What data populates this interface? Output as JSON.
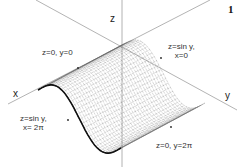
{
  "figure": {
    "number": "1",
    "type": "3d-surface-wireframe",
    "surface": "z = sin y",
    "axes": {
      "x": "x",
      "y": "y",
      "z": "z"
    },
    "boundary_labels": [
      {
        "line1": "z=0,  y=0",
        "line2": ""
      },
      {
        "line1": "z=sin y,",
        "line2": "x=0"
      },
      {
        "line1": "z=sin y,",
        "line2": "x= 2π"
      },
      {
        "line1": "z=0,  y=2π",
        "line2": ""
      }
    ],
    "colors": {
      "axis": "#999999",
      "mesh": "#555555",
      "text": "#333333",
      "background": "#ffffff"
    }
  }
}
